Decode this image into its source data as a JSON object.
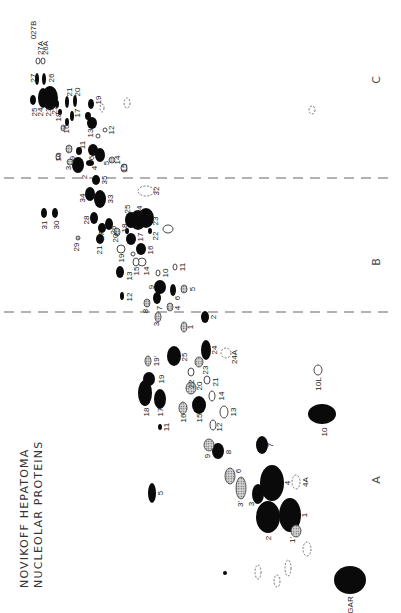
{
  "title": {
    "line1": "NOVIKOFF HEPATOMA",
    "line2": "NUCLEOLAR PROTEINS"
  },
  "regions": [
    {
      "label": "A",
      "x": 380,
      "y": 480
    },
    {
      "label": "B",
      "x": 380,
      "y": 262
    },
    {
      "label": "C",
      "x": 380,
      "y": 80
    }
  ],
  "dividers": [
    {
      "y": 312
    },
    {
      "y": 178
    }
  ],
  "legend_types": {
    "solid": "major spot",
    "hatch": "hatched spot",
    "open": "open spot",
    "dash": "faint / dashed spot"
  },
  "spots": [
    {
      "id": "GAR",
      "type": "solid",
      "cx": 350,
      "cy": 580,
      "rx": 16,
      "ry": 14,
      "lx": 350,
      "ly": 605
    },
    {
      "id": "1",
      "type": "solid",
      "cx": 290,
      "cy": 515,
      "rx": 11,
      "ry": 17,
      "lx": 304,
      "ly": 515
    },
    {
      "id": "2",
      "type": "solid",
      "cx": 268,
      "cy": 517,
      "rx": 12,
      "ry": 16,
      "lx": 268,
      "ly": 538
    },
    {
      "id": "3",
      "type": "solid",
      "cx": 258,
      "cy": 494,
      "rx": 6,
      "ry": 10,
      "lx": 251,
      "ly": 504
    },
    {
      "id": "3'",
      "type": "hatch",
      "cx": 241,
      "cy": 488,
      "rx": 5,
      "ry": 11,
      "lx": 240,
      "ly": 504
    },
    {
      "id": "4",
      "type": "solid",
      "cx": 272,
      "cy": 483,
      "rx": 12,
      "ry": 18,
      "lx": 287,
      "ly": 483
    },
    {
      "id": "4A",
      "type": "dash",
      "cx": 296,
      "cy": 482,
      "rx": 4,
      "ry": 7,
      "lx": 305,
      "ly": 482
    },
    {
      "id": "1'",
      "type": "hatch",
      "cx": 296,
      "cy": 531,
      "rx": 5,
      "ry": 6,
      "lx": 292,
      "ly": 540
    },
    {
      "id": "5",
      "type": "solid",
      "cx": 152,
      "cy": 493,
      "rx": 4,
      "ry": 10,
      "lx": 160,
      "ly": 493
    },
    {
      "id": "6",
      "type": "hatch",
      "cx": 230,
      "cy": 476,
      "rx": 5,
      "ry": 8,
      "lx": 238,
      "ly": 471
    },
    {
      "id": "7",
      "type": "solid",
      "cx": 262,
      "cy": 445,
      "rx": 6,
      "ry": 9,
      "lx": 270,
      "ly": 445
    },
    {
      "id": "8",
      "type": "solid",
      "cx": 218,
      "cy": 451,
      "rx": 6,
      "ry": 8,
      "lx": 228,
      "ly": 452
    },
    {
      "id": "9",
      "type": "hatch",
      "cx": 209,
      "cy": 445,
      "rx": 5,
      "ry": 6,
      "lx": 207,
      "ly": 456
    },
    {
      "id": "10",
      "type": "solid",
      "cx": 322,
      "cy": 414,
      "rx": 14,
      "ry": 10,
      "lx": 324,
      "ly": 432
    },
    {
      "id": "10L",
      "type": "open",
      "cx": 318,
      "cy": 370,
      "rx": 4,
      "ry": 5,
      "lx": 318,
      "ly": 384
    },
    {
      "id": "11",
      "type": "solid",
      "cx": 160,
      "cy": 427,
      "rx": 2,
      "ry": 3,
      "lx": 166,
      "ly": 427
    },
    {
      "id": "12",
      "type": "open",
      "cx": 213,
      "cy": 425,
      "rx": 3,
      "ry": 5,
      "lx": 219,
      "ly": 427
    },
    {
      "id": "13",
      "type": "open",
      "cx": 224,
      "cy": 412,
      "rx": 4,
      "ry": 6,
      "lx": 233,
      "ly": 412
    },
    {
      "id": "14",
      "type": "open",
      "cx": 212,
      "cy": 396,
      "rx": 3,
      "ry": 5,
      "lx": 221,
      "ly": 396
    },
    {
      "id": "15",
      "type": "solid",
      "cx": 199,
      "cy": 405,
      "rx": 7,
      "ry": 9,
      "lx": 199,
      "ly": 418
    },
    {
      "id": "16",
      "type": "hatch",
      "cx": 183,
      "cy": 408,
      "rx": 4,
      "ry": 6,
      "lx": 183,
      "ly": 418
    },
    {
      "id": "17",
      "type": "solid",
      "cx": 160,
      "cy": 399,
      "rx": 6,
      "ry": 10,
      "lx": 160,
      "ly": 412
    },
    {
      "id": "18",
      "type": "solid",
      "cx": 145,
      "cy": 393,
      "rx": 7,
      "ry": 13,
      "lx": 146,
      "ly": 412
    },
    {
      "id": "19",
      "type": "solid",
      "cx": 149,
      "cy": 379,
      "rx": 6,
      "ry": 7,
      "lx": 161,
      "ly": 379
    },
    {
      "id": "19'",
      "type": "hatch",
      "cx": 148,
      "cy": 361,
      "rx": 3,
      "ry": 5,
      "lx": 156,
      "ly": 361
    },
    {
      "id": "20",
      "type": "hatch",
      "cx": 191,
      "cy": 388,
      "rx": 5,
      "ry": 6,
      "lx": 199,
      "ly": 386
    },
    {
      "id": "21",
      "type": "open",
      "cx": 207,
      "cy": 380,
      "rx": 3,
      "ry": 4,
      "lx": 215,
      "ly": 382
    },
    {
      "id": "22",
      "type": "open",
      "cx": 191,
      "cy": 372,
      "rx": 3,
      "ry": 4,
      "lx": 191,
      "ly": 384
    },
    {
      "id": "23",
      "type": "hatch",
      "cx": 199,
      "cy": 362,
      "rx": 4,
      "ry": 5,
      "lx": 205,
      "ly": 370
    },
    {
      "id": "24",
      "type": "solid",
      "cx": 206,
      "cy": 350,
      "rx": 5,
      "ry": 10,
      "lx": 214,
      "ly": 350
    },
    {
      "id": "24A",
      "type": "dash",
      "cx": 226,
      "cy": 353,
      "rx": 5,
      "ry": 5,
      "lx": 234,
      "ly": 357
    },
    {
      "id": "25",
      "type": "solid",
      "cx": 174,
      "cy": 356,
      "rx": 7,
      "ry": 10,
      "lx": 184,
      "ly": 357
    },
    {
      "id": "B-1",
      "type": "hatch",
      "cx": 184,
      "cy": 327,
      "rx": 3,
      "ry": 5,
      "lx": 190,
      "ly": 327
    },
    {
      "id": "B-2",
      "type": "solid",
      "cx": 205,
      "cy": 317,
      "rx": 4,
      "ry": 6,
      "lx": 213,
      "ly": 317
    },
    {
      "id": "B-3",
      "type": "hatch",
      "cx": 158,
      "cy": 317,
      "rx": 3,
      "ry": 5,
      "lx": 156,
      "ly": 324
    },
    {
      "id": "B-4",
      "type": "hatch",
      "cx": 170,
      "cy": 307,
      "rx": 3,
      "ry": 4,
      "lx": 177,
      "ly": 308
    },
    {
      "id": "B-5",
      "type": "hatch",
      "cx": 184,
      "cy": 289,
      "rx": 3,
      "ry": 4,
      "lx": 192,
      "ly": 289
    },
    {
      "id": "B-6",
      "type": "solid",
      "cx": 173,
      "cy": 290,
      "rx": 3,
      "ry": 6,
      "lx": 177,
      "ly": 298
    },
    {
      "id": "B-7",
      "type": "solid",
      "cx": 157,
      "cy": 298,
      "rx": 4,
      "ry": 6,
      "lx": 159,
      "ly": 308
    },
    {
      "id": "B-8",
      "type": "hatch",
      "cx": 147,
      "cy": 303,
      "rx": 3,
      "ry": 4,
      "lx": 145,
      "ly": 311
    },
    {
      "id": "B-9",
      "type": "solid",
      "cx": 160,
      "cy": 287,
      "rx": 6,
      "ry": 7,
      "lx": 151,
      "ly": 287
    },
    {
      "id": "B-10",
      "type": "open",
      "cx": 158,
      "cy": 273,
      "rx": 2,
      "ry": 3,
      "lx": 165,
      "ly": 273
    },
    {
      "id": "B-11",
      "type": "open",
      "cx": 175,
      "cy": 267,
      "rx": 2,
      "ry": 3,
      "lx": 182,
      "ly": 267
    },
    {
      "id": "B-12",
      "type": "solid",
      "cx": 122,
      "cy": 296,
      "rx": 2,
      "ry": 4,
      "lx": 129,
      "ly": 297
    },
    {
      "id": "B-13",
      "type": "solid",
      "cx": 120,
      "cy": 272,
      "rx": 4,
      "ry": 6,
      "lx": 129,
      "ly": 276
    },
    {
      "id": "B-14",
      "type": "open",
      "cx": 142,
      "cy": 262,
      "rx": 4,
      "ry": 4,
      "lx": 146,
      "ly": 271
    },
    {
      "id": "B-15",
      "type": "open",
      "cx": 136,
      "cy": 262,
      "rx": 3,
      "ry": 4,
      "lx": 136,
      "ly": 271
    },
    {
      "id": "B-16",
      "type": "solid",
      "cx": 141,
      "cy": 249,
      "rx": 5,
      "ry": 6,
      "lx": 150,
      "ly": 250
    },
    {
      "id": "B-16x",
      "type": "open",
      "cx": 133,
      "cy": 254,
      "rx": 2,
      "ry": 2,
      "lx": 131,
      "ly": 254
    },
    {
      "id": "B-19",
      "type": "open",
      "cx": 121,
      "cy": 249,
      "rx": 4,
      "ry": 4,
      "lx": 121,
      "ly": 258
    },
    {
      "id": "B-17",
      "type": "solid",
      "cx": 131,
      "cy": 239,
      "rx": 5,
      "ry": 6,
      "lx": 140,
      "ly": 237
    },
    {
      "id": "B-18",
      "type": "solid",
      "cx": 127,
      "cy": 231,
      "rx": 2,
      "ry": 3,
      "lx": 124,
      "ly": 228
    },
    {
      "id": "B-22",
      "type": "solid",
      "cx": 150,
      "cy": 231,
      "rx": 2,
      "ry": 3,
      "lx": 155,
      "ly": 236
    },
    {
      "id": "B-23",
      "type": "solid",
      "cx": 146,
      "cy": 218,
      "rx": 8,
      "ry": 10,
      "lx": 155,
      "ly": 221
    },
    {
      "id": "B-24",
      "type": "solid",
      "cx": 138,
      "cy": 220,
      "rx": 8,
      "ry": 10,
      "lx": 139,
      "ly": 210
    },
    {
      "id": "B-25",
      "type": "solid",
      "cx": 131,
      "cy": 220,
      "rx": 6,
      "ry": 8,
      "lx": 127,
      "ly": 209
    },
    {
      "id": "B-2x",
      "type": "open",
      "cx": 168,
      "cy": 229,
      "rx": 5,
      "ry": 4,
      "lx": 168,
      "ly": 229
    },
    {
      "id": "B-26",
      "type": "solid",
      "cx": 109,
      "cy": 224,
      "rx": 4,
      "ry": 6,
      "lx": 113,
      "ly": 230
    },
    {
      "id": "B-27",
      "type": "solid",
      "cx": 102,
      "cy": 228,
      "rx": 4,
      "ry": 5,
      "lx": 101,
      "ly": 236
    },
    {
      "id": "B-20",
      "type": "hatch",
      "cx": 117,
      "cy": 232,
      "rx": 3,
      "ry": 4,
      "lx": 115,
      "ly": 238
    },
    {
      "id": "B-28",
      "type": "solid",
      "cx": 94,
      "cy": 218,
      "rx": 4,
      "ry": 6,
      "lx": 86,
      "ly": 220
    },
    {
      "id": "B-21",
      "type": "solid",
      "cx": 100,
      "cy": 239,
      "rx": 4,
      "ry": 5,
      "lx": 99,
      "ly": 250
    },
    {
      "id": "B-29",
      "type": "hatch",
      "cx": 78,
      "cy": 238,
      "rx": 2,
      "ry": 2,
      "lx": 76,
      "ly": 247
    },
    {
      "id": "B-30",
      "type": "solid",
      "cx": 55,
      "cy": 213,
      "rx": 3,
      "ry": 5,
      "lx": 56,
      "ly": 225
    },
    {
      "id": "B-31",
      "type": "solid",
      "cx": 44,
      "cy": 213,
      "rx": 3,
      "ry": 5,
      "lx": 44,
      "ly": 225
    },
    {
      "id": "B-32",
      "type": "dash",
      "cx": 146,
      "cy": 191,
      "rx": 8,
      "ry": 5,
      "lx": 156,
      "ly": 191
    },
    {
      "id": "B-33",
      "type": "solid",
      "cx": 100,
      "cy": 199,
      "rx": 6,
      "ry": 9,
      "lx": 110,
      "ly": 199
    },
    {
      "id": "B-34",
      "type": "solid",
      "cx": 90,
      "cy": 194,
      "rx": 5,
      "ry": 7,
      "lx": 82,
      "ly": 198
    },
    {
      "id": "B-35",
      "type": "solid",
      "cx": 96,
      "cy": 180,
      "rx": 4,
      "ry": 5,
      "lx": 104,
      "ly": 180
    },
    {
      "id": "C-2",
      "type": "solid",
      "cx": 78,
      "cy": 165,
      "rx": 6,
      "ry": 8,
      "lx": 84,
      "ly": 177
    },
    {
      "id": "C-3",
      "type": "hatch",
      "cx": 70,
      "cy": 162,
      "rx": 3,
      "ry": 3,
      "lx": 68,
      "ly": 168
    },
    {
      "id": "C-4",
      "type": "solid",
      "cx": 90,
      "cy": 163,
      "rx": 4,
      "ry": 3,
      "lx": 94,
      "ly": 168
    },
    {
      "id": "C-5",
      "type": "solid",
      "cx": 100,
      "cy": 155,
      "rx": 5,
      "ry": 7,
      "lx": 106,
      "ly": 163
    },
    {
      "id": "C-6",
      "type": "solid",
      "cx": 93,
      "cy": 150,
      "rx": 5,
      "ry": 6,
      "lx": 91,
      "ly": 158
    },
    {
      "id": "C-9",
      "type": "hatch",
      "cx": 69,
      "cy": 149,
      "rx": 3,
      "ry": 4,
      "lx": 72,
      "ly": 158
    },
    {
      "id": "C-10",
      "type": "open",
      "cx": 58,
      "cy": 157,
      "rx": 2,
      "ry": 3,
      "lx": 58,
      "ly": 157
    },
    {
      "id": "C-11",
      "type": "solid",
      "cx": 79,
      "cy": 151,
      "rx": 3,
      "ry": 4,
      "lx": 82,
      "ly": 145
    },
    {
      "id": "C-14",
      "type": "hatch",
      "cx": 112,
      "cy": 160,
      "rx": 3,
      "ry": 3,
      "lx": 117,
      "ly": 160
    },
    {
      "id": "C-15",
      "type": "open",
      "cx": 124,
      "cy": 168,
      "rx": 3,
      "ry": 4,
      "lx": 124,
      "ly": 168
    },
    {
      "id": "C-12",
      "type": "open",
      "cx": 105,
      "cy": 130,
      "rx": 2,
      "ry": 2,
      "lx": 111,
      "ly": 130
    },
    {
      "id": "C-13",
      "type": "solid",
      "cx": 92,
      "cy": 123,
      "rx": 5,
      "ry": 6,
      "lx": 90,
      "ly": 133
    },
    {
      "id": "C-13b",
      "type": "open",
      "cx": 98,
      "cy": 136,
      "rx": 2,
      "ry": 2,
      "lx": 100,
      "ly": 138
    },
    {
      "id": "C-14b",
      "type": "solid",
      "cx": 88,
      "cy": 116,
      "rx": 3,
      "ry": 4,
      "lx": 96,
      "ly": 118
    },
    {
      "id": "C-19",
      "type": "solid",
      "cx": 91,
      "cy": 104,
      "rx": 3,
      "ry": 5,
      "lx": 98,
      "ly": 100
    },
    {
      "id": "C-19d",
      "type": "dash",
      "cx": 102,
      "cy": 108,
      "rx": 2,
      "ry": 4,
      "lx": 102,
      "ly": 108
    },
    {
      "id": "C-C-dash",
      "type": "dash",
      "cx": 127,
      "cy": 103,
      "rx": 3,
      "ry": 5,
      "lx": 127,
      "ly": 103
    },
    {
      "id": "C-20",
      "type": "solid",
      "cx": 75,
      "cy": 101,
      "rx": 2,
      "ry": 6,
      "lx": 77,
      "ly": 92
    },
    {
      "id": "C-21",
      "type": "solid",
      "cx": 67,
      "cy": 102,
      "rx": 2,
      "ry": 6,
      "lx": 69,
      "ly": 92
    },
    {
      "id": "C-17",
      "type": "solid",
      "cx": 72,
      "cy": 116,
      "rx": 2,
      "ry": 5,
      "lx": 77,
      "ly": 113
    },
    {
      "id": "C-16",
      "type": "solid",
      "cx": 67,
      "cy": 122,
      "rx": 2,
      "ry": 4,
      "lx": 66,
      "ly": 129
    },
    {
      "id": "C-18",
      "type": "solid",
      "cx": 60,
      "cy": 112,
      "rx": 2,
      "ry": 3,
      "lx": 58,
      "ly": 117
    },
    {
      "id": "C-18b",
      "type": "hatch",
      "cx": 63,
      "cy": 128,
      "rx": 2,
      "ry": 3,
      "lx": 60,
      "ly": 136
    },
    {
      "id": "C-22",
      "type": "solid",
      "cx": 57,
      "cy": 104,
      "rx": 2,
      "ry": 4,
      "lx": 54,
      "ly": 110
    },
    {
      "id": "C-23",
      "type": "solid",
      "cx": 50,
      "cy": 98,
      "rx": 8,
      "ry": 12,
      "lx": 48,
      "ly": 112
    },
    {
      "id": "C-24",
      "type": "solid",
      "cx": 43,
      "cy": 98,
      "rx": 5,
      "ry": 10,
      "lx": 40,
      "ly": 112
    },
    {
      "id": "C-25",
      "type": "solid",
      "cx": 33,
      "cy": 100,
      "rx": 3,
      "ry": 5,
      "lx": 34,
      "ly": 112
    },
    {
      "id": "C-26",
      "type": "solid",
      "cx": 44,
      "cy": 79,
      "rx": 2,
      "ry": 6,
      "lx": 51,
      "ly": 78
    },
    {
      "id": "C-27",
      "type": "solid",
      "cx": 37,
      "cy": 79,
      "rx": 2,
      "ry": 6,
      "lx": 33,
      "ly": 78
    },
    {
      "id": "C-27A",
      "type": "open",
      "cx": 38,
      "cy": 61,
      "rx": 2,
      "ry": 3,
      "lx": 40,
      "ly": 48
    },
    {
      "id": "C-26A",
      "type": "open",
      "cx": 43,
      "cy": 61,
      "rx": 2,
      "ry": 3,
      "lx": 45,
      "ly": 48
    },
    {
      "id": "C-027B",
      "type": "open",
      "cx": 37,
      "cy": 42,
      "rx": 0,
      "ry": 0,
      "lx": 33,
      "ly": 30
    },
    {
      "id": "dash-A1",
      "type": "dash",
      "cx": 258,
      "cy": 572,
      "rx": 3,
      "ry": 7,
      "lx": 258,
      "ly": 572
    },
    {
      "id": "dash-A2",
      "type": "dash",
      "cx": 277,
      "cy": 581,
      "rx": 3,
      "ry": 6,
      "lx": 277,
      "ly": 581
    },
    {
      "id": "dash-A3",
      "type": "dash",
      "cx": 288,
      "cy": 568,
      "rx": 3,
      "ry": 8,
      "lx": 288,
      "ly": 568
    },
    {
      "id": "dash-A4",
      "type": "dash",
      "cx": 307,
      "cy": 549,
      "rx": 4,
      "ry": 7,
      "lx": 307,
      "ly": 549
    },
    {
      "id": "dot-A",
      "type": "solid",
      "cx": 225,
      "cy": 573,
      "rx": 2,
      "ry": 2,
      "lx": 225,
      "ly": 573
    },
    {
      "id": "open-C",
      "type": "dash",
      "cx": 312,
      "cy": 110,
      "rx": 3,
      "ry": 4,
      "lx": 312,
      "ly": 110
    }
  ],
  "visible_labels": {
    "A": [
      "GAR",
      "1",
      "1'",
      "2",
      "3",
      "3'",
      "4",
      "4A",
      "5",
      "6",
      "7",
      "8",
      "9",
      "10",
      "10L",
      "11",
      "12",
      "13",
      "14",
      "15",
      "16",
      "17",
      "18",
      "19",
      "19'",
      "20",
      "21",
      "22",
      "23",
      "24",
      "24A",
      "25"
    ],
    "B": [
      "1",
      "2",
      "3",
      "4",
      "5",
      "6",
      "7",
      "8",
      "9",
      "10",
      "11",
      "12",
      "13",
      "14",
      "15",
      "16",
      "17",
      "18",
      "19",
      "20",
      "21",
      "22",
      "23",
      "24",
      "25",
      "26",
      "27",
      "28",
      "29",
      "30",
      "31",
      "32",
      "33",
      "34",
      "35"
    ],
    "C": [
      "2",
      "3",
      "4",
      "5",
      "6",
      "9",
      "10",
      "11",
      "12",
      "13",
      "14",
      "15",
      "16",
      "17",
      "18",
      "19",
      "20",
      "21",
      "22",
      "23",
      "24",
      "25",
      "26",
      "27",
      "26A",
      "27A",
      "027B"
    ]
  }
}
